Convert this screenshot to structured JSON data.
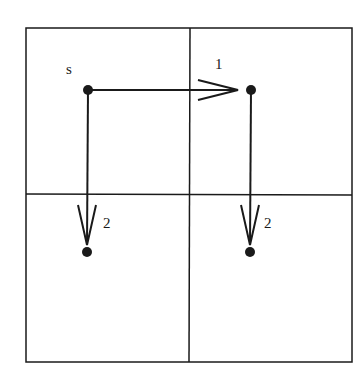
{
  "diagram": {
    "grid": {
      "rows": 2,
      "cols": 2
    },
    "nodes": [
      {
        "id": "s",
        "label": "s"
      },
      {
        "id": "n1",
        "label": "1"
      },
      {
        "id": "n2a",
        "label": "2"
      },
      {
        "id": "n2b",
        "label": "2"
      }
    ],
    "edges": [
      {
        "from": "s",
        "to": "n1"
      },
      {
        "from": "s",
        "to": "n2a"
      },
      {
        "from": "n1",
        "to": "n2b"
      }
    ],
    "colors": {
      "line": "#1a1a1a",
      "background": "#ffffff"
    }
  }
}
